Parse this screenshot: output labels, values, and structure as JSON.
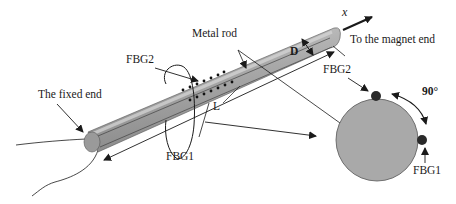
{
  "diagram": {
    "labels": {
      "metal_rod": "Metal rod",
      "fbg2_top": "FBG2",
      "fixed_end": "The fixed end",
      "fbg1_bottom": "FBG1",
      "length": "L",
      "diameter": "D",
      "x_axis": "x",
      "magnet_end": "To the magnet end",
      "fbg2_cross": "FBG2",
      "angle": "90°",
      "fbg1_cross": "FBG1"
    },
    "colors": {
      "rod_fill": "#a8a8a8",
      "rod_highlight": "#c8c8c8",
      "rod_end": "#9a9a9a",
      "cross_section_fill": "#a9a9a9",
      "sensor_dot": "#2a2a2a",
      "line": "#1a1a1a"
    }
  }
}
